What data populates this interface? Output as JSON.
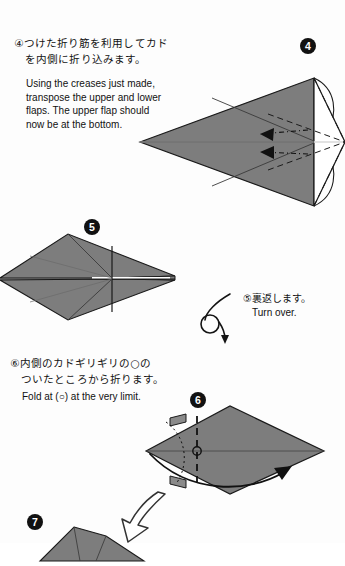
{
  "page": {
    "width": 345,
    "height": 543,
    "background_color": "#fdfdfd",
    "paper_fill_color": "#7d7d7d",
    "paper_fill_light": "#8a8a8a",
    "line_color": "#1a1a1a"
  },
  "steps": [
    {
      "id": "step-4",
      "badge": "❸",
      "badge_number": "4",
      "instruction_jp": "④つけた折り筋を利用してカド\n　を内側に折り込みます。",
      "instruction_en": "Using  the creases just  made,\ntranspose the upper and lower\nflaps. The  upper  flap  should\nnow be at the bottom.",
      "diagram": "arrowhead-dart-with-inside-reverse-folds"
    },
    {
      "id": "step-5",
      "badge": "❹",
      "badge_number": "5",
      "caption_jp": "⑤裏返します。",
      "caption_en": "Turn over.",
      "diagram": "narrow-diamond-kite"
    },
    {
      "id": "step-6",
      "badge": "❺",
      "badge_number": "6",
      "instruction_jp": "⑥内側のカドギリギリの○の\n　ついたところから折ります。",
      "instruction_en": "Fold at (○) at the very limit.",
      "diagram": "diamond-with-vertical-valley-fold"
    },
    {
      "id": "step-7",
      "badge": "❻",
      "badge_number": "7",
      "diagram": "partial-folded-form-cropped"
    }
  ],
  "symbols": {
    "turn_over_arrow": "loop-flip-arrow",
    "progress_arrow": "hollow-curved-arrow-down-left",
    "fold_arrow": "sweeping-solid-arrow-right",
    "tuck_arrow": "solid-triangle-arrow-left",
    "limit_marker": "small-circle-marker"
  }
}
